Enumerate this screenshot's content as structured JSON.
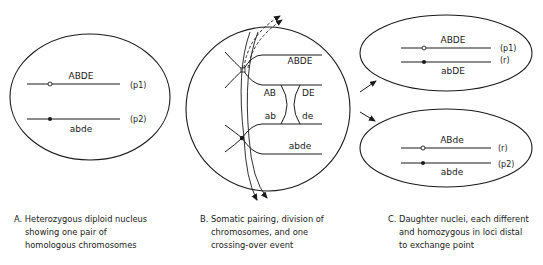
{
  "panel_a": {
    "top_chromosome_label": "ABDE",
    "bottom_chromosome_label": "abde",
    "top_tag": "(p1)",
    "bottom_tag": "(p2)",
    "caption": [
      "A.  Heterozygous diploid nucleus",
      "showing one pair of",
      "homologous chromosomes"
    ]
  },
  "panel_b": {
    "top_label": "ABDE",
    "mid_left_upper": "AB",
    "mid_right_upper": "DE",
    "mid_left_lower": "ab",
    "mid_right_lower": "de",
    "bottom_label": "abde",
    "caption": [
      "B.  Somatic pairing, division of",
      "chromosomes, and one",
      "crossing-over event"
    ]
  },
  "panel_c": {
    "upper_nucleus": {
      "top_label": "ABDE",
      "bottom_label": "abDE",
      "top_tag": "(p1)",
      "bottom_tag": "(r)"
    },
    "lower_nucleus": {
      "top_label": "ABde",
      "bottom_label": "abde",
      "top_tag": "(r)",
      "bottom_tag": "(p2)"
    },
    "caption": [
      "C.  Daughter nuclei, each different",
      "and homozygous in loci distal",
      "to exchange point"
    ]
  }
}
